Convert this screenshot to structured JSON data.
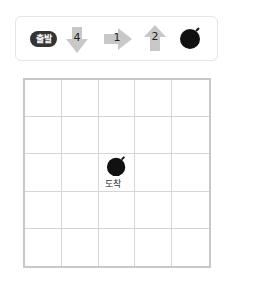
{
  "sequence": {
    "start_label": "출발",
    "steps": [
      {
        "direction": "down",
        "count": "4",
        "icon": "down-arrow-icon"
      },
      {
        "direction": "right",
        "count": "1",
        "icon": "right-arrow-icon"
      },
      {
        "direction": "up",
        "count": "2",
        "icon": "up-arrow-icon"
      }
    ],
    "end_icon": "bomb-icon"
  },
  "grid": {
    "rows": 5,
    "cols": 5,
    "goal": {
      "row": 2,
      "col": 2,
      "icon": "bomb-icon",
      "label": "도착"
    }
  },
  "colors": {
    "arrow": "#c8c8c8",
    "grid_line": "#d6d6d6",
    "bomb": "#111111",
    "start_badge": "#333333"
  }
}
